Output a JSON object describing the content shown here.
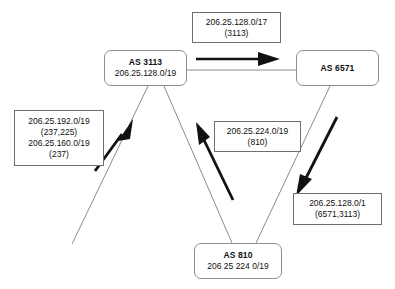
{
  "diagram": {
    "nodes": [
      {
        "id": "as3113",
        "name": "AS 3113",
        "prefix": "206.25.128.0/19",
        "x": 104,
        "y": 50,
        "w": 83,
        "h": 36
      },
      {
        "id": "as6571",
        "name": "AS 6571",
        "prefix": "",
        "x": 296,
        "y": 50,
        "w": 83,
        "h": 36
      },
      {
        "id": "as810",
        "name": "AS 810",
        "prefix": "206 25 224 0/19",
        "x": 194,
        "y": 243,
        "w": 88,
        "h": 36
      }
    ],
    "labels": [
      {
        "id": "label-top",
        "x": 192,
        "y": 12,
        "w": 89,
        "h": 31,
        "lines": [
          "206.25.128.0/17",
          "(3113)"
        ]
      },
      {
        "id": "label-left",
        "x": 14,
        "y": 110,
        "w": 90,
        "h": 56,
        "lines": [
          "206.25.192.0/19",
          "(237,225)",
          "206.25.160.0/19",
          "(237)"
        ]
      },
      {
        "id": "label-middle",
        "x": 214,
        "y": 121,
        "w": 87,
        "h": 31,
        "lines": [
          "206.25.224.0/19",
          "(810)"
        ]
      },
      {
        "id": "label-right",
        "x": 293,
        "y": 193,
        "w": 89,
        "h": 32,
        "lines": [
          "206.25.128.0/1",
          "(6571,3113)"
        ]
      }
    ],
    "peering_links": [
      {
        "id": "link-3113-6571",
        "from": "as3113",
        "to": "as6571"
      },
      {
        "id": "link-3113-810",
        "from": "as3113",
        "to": "as810"
      },
      {
        "id": "link-6571-810",
        "from": "as6571",
        "to": "as810"
      },
      {
        "id": "link-3113-downleft",
        "from": "as3113",
        "to": "open-end"
      }
    ],
    "advertisement_arrows": [
      {
        "id": "arrow-3113-to-6571",
        "direction": "right",
        "label": "label-top"
      },
      {
        "id": "arrow-up-right-to-3113",
        "direction": "up-right",
        "label": "label-left"
      },
      {
        "id": "arrow-810-to-3113",
        "direction": "up-left",
        "label": "label-middle"
      },
      {
        "id": "arrow-6571-to-810",
        "direction": "down-left",
        "label": "label-right"
      }
    ]
  },
  "colors": {
    "wire": "#8c8c8c",
    "arrow": "#111111",
    "node_border": "#8e8e8e",
    "label_border": "#6f6f6f",
    "text": "#101010",
    "background": "#ffffff"
  }
}
